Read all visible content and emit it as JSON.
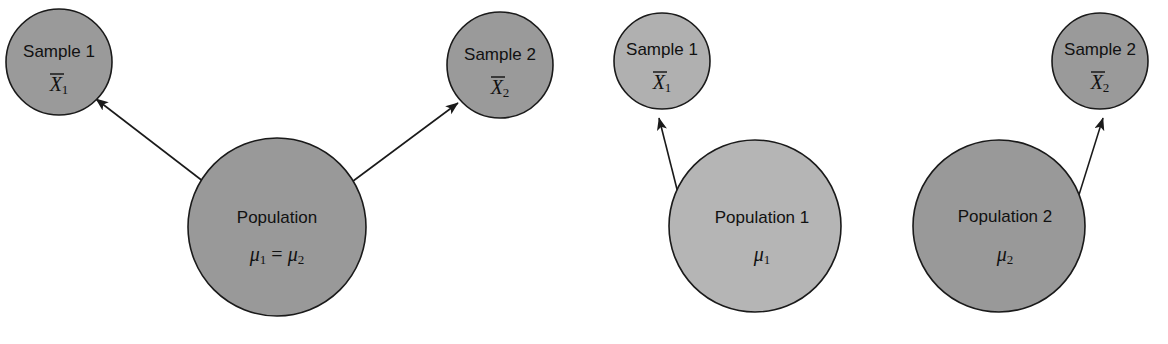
{
  "figure": {
    "background_color": "#ffffff",
    "stroke_color": "#1a1a1a",
    "text_color": "#111111",
    "panels": [
      {
        "id": "panel-one-population",
        "name": "one-population",
        "nodes": [
          {
            "id": "sample-1",
            "role": "sample",
            "label": "Sample 1",
            "symbol_base": "X",
            "symbol_sub": "1",
            "has_overbar": true,
            "cx": 59,
            "cy": 62,
            "r": 53,
            "fill": "#9a9a9a"
          },
          {
            "id": "sample-2",
            "role": "sample",
            "label": "Sample 2",
            "symbol_base": "X",
            "symbol_sub": "2",
            "has_overbar": true,
            "cx": 500,
            "cy": 65,
            "r": 53,
            "fill": "#9a9a9a"
          },
          {
            "id": "population",
            "role": "population",
            "label": "Population",
            "symbol_base": "μ",
            "symbol_sub": "1",
            "symbol_equals": "=",
            "symbol_base2": "μ",
            "symbol_sub2": "2",
            "has_overbar": false,
            "cx": 277,
            "cy": 227,
            "r": 89,
            "fill": "#999999"
          }
        ],
        "arrows": [
          {
            "id": "arrow-population-to-sample-1",
            "from": "population",
            "to": "sample-1",
            "x1": 217,
            "y1": 192,
            "x2": 96,
            "y2": 99
          },
          {
            "id": "arrow-population-to-sample-2",
            "from": "population",
            "to": "sample-2",
            "x1": 337,
            "y1": 193,
            "x2": 458,
            "y2": 103
          }
        ]
      },
      {
        "id": "panel-population-1",
        "name": "population-one",
        "nodes": [
          {
            "id": "sample-1b",
            "role": "sample",
            "label": "Sample 1",
            "symbol_base": "X",
            "symbol_sub": "1",
            "has_overbar": true,
            "cx": 662,
            "cy": 61,
            "r": 48,
            "fill": "#b0b0b0"
          },
          {
            "id": "population-1",
            "role": "population",
            "label": "Population 1",
            "symbol_base": "μ",
            "symbol_sub": "1",
            "has_overbar": false,
            "cx": 755,
            "cy": 226,
            "r": 86,
            "fill": "#b5b5b5"
          }
        ],
        "arrows": [
          {
            "id": "arrow-population-1-to-sample-1",
            "from": "population-1",
            "to": "sample-1b",
            "x1": 683,
            "y1": 213,
            "x2": 659,
            "y2": 118
          }
        ]
      },
      {
        "id": "panel-population-2",
        "name": "population-two",
        "nodes": [
          {
            "id": "sample-2b",
            "role": "sample",
            "label": "Sample 2",
            "symbol_base": "X",
            "symbol_sub": "2",
            "has_overbar": true,
            "cx": 1100,
            "cy": 61,
            "r": 48,
            "fill": "#9a9a9a"
          },
          {
            "id": "population-2",
            "role": "population",
            "label": "Population 2",
            "symbol_base": "μ",
            "symbol_sub": "2",
            "has_overbar": false,
            "cx": 999,
            "cy": 226,
            "r": 86,
            "fill": "#999999"
          }
        ],
        "arrows": [
          {
            "id": "arrow-population-2-to-sample-2",
            "from": "population-2",
            "to": "sample-2b",
            "x1": 1073,
            "y1": 214,
            "x2": 1103,
            "y2": 118
          }
        ]
      }
    ]
  }
}
